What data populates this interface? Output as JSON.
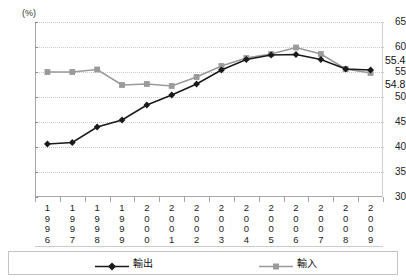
{
  "header": {
    "cropped_title": "",
    "unit_label": "(%)"
  },
  "chart_data": {
    "type": "line",
    "title": "",
    "xlabel": "",
    "ylabel": "(%)",
    "ylim": [
      30,
      65
    ],
    "yticks": [
      30,
      35,
      40,
      45,
      50,
      55,
      60,
      65
    ],
    "grid": true,
    "legend_position": "bottom",
    "categories": [
      "1996",
      "1997",
      "1998",
      "1999",
      "2000",
      "2001",
      "2002",
      "2003",
      "2004",
      "2005",
      "2006",
      "2007",
      "2008",
      "2009"
    ],
    "series": [
      {
        "name": "輸出",
        "color": "#1a1a1a",
        "marker": "diamond",
        "values": [
          40.6,
          40.9,
          44.0,
          45.4,
          48.4,
          50.4,
          52.6,
          55.4,
          57.5,
          58.4,
          58.5,
          57.5,
          55.6,
          55.4
        ]
      },
      {
        "name": "輸入",
        "color": "#9a9a9a",
        "marker": "square",
        "values": [
          55.0,
          55.0,
          55.5,
          52.4,
          52.6,
          52.2,
          54.0,
          56.2,
          57.8,
          58.6,
          59.9,
          58.6,
          55.6,
          54.8
        ]
      }
    ],
    "annotations": [
      {
        "text": "55.4",
        "series": "輸出",
        "category": "2009",
        "value": 55.4
      },
      {
        "text": "54.8",
        "series": "輸入",
        "category": "2009",
        "value": 54.8
      }
    ]
  },
  "axis": {
    "y_tick_labels": [
      "65",
      "60",
      "55",
      "50",
      "45",
      "40",
      "35",
      "30"
    ],
    "x_tick_labels": [
      "1996",
      "1997",
      "1998",
      "1999",
      "2000",
      "2001",
      "2002",
      "2003",
      "2004",
      "2005",
      "2006",
      "2007",
      "2008",
      "2009"
    ]
  },
  "legend": {
    "items": [
      {
        "label": "輸出",
        "color": "#1a1a1a",
        "marker": "diamond"
      },
      {
        "label": "輸入",
        "color": "#9a9a9a",
        "marker": "square"
      }
    ]
  },
  "callouts": {
    "exports_last": "55.4",
    "imports_last": "54.8"
  }
}
